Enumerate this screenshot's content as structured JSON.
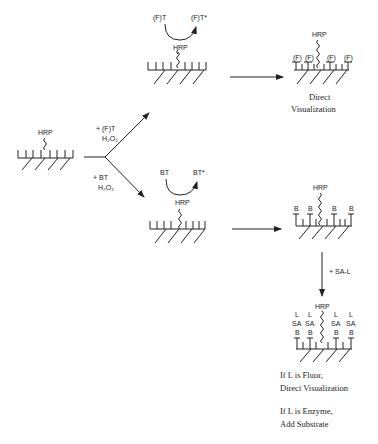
{
  "diagram": {
    "start": {
      "enzyme": "HRP"
    },
    "branch_top": {
      "reagent": "+ (F)T",
      "cofactor": "H₂O₂"
    },
    "branch_bottom": {
      "reagent": "+ BT",
      "cofactor": "H₂O₂"
    },
    "top_reaction": {
      "substrate": "(F)T",
      "product": "(F)T*",
      "enzyme": "HRP"
    },
    "bottom_reaction": {
      "substrate": "BT",
      "product": "BT*",
      "enzyme": "HRP"
    },
    "top_result": {
      "enzyme": "HRP",
      "labels": [
        "(F)",
        "(F)",
        "(F)",
        "(F)"
      ],
      "caption_line1": "Direct",
      "caption_line2": "Visualization"
    },
    "bottom_result": {
      "enzyme": "HRP",
      "labels": [
        "B",
        "B",
        "B",
        "B"
      ]
    },
    "step": {
      "reagent": "+ SA-L"
    },
    "final_result": {
      "enzyme": "HRP",
      "layer_L": [
        "L",
        "L",
        "L",
        "L"
      ],
      "layer_SA": [
        "SA",
        "SA",
        "SA",
        "SA"
      ],
      "layer_B": [
        "B",
        "B",
        "B",
        "B"
      ],
      "note1_line1": "If L is Fluor,",
      "note1_line2": "Direct  Visualization",
      "note2_line1": "If L is Enzyme,",
      "note2_line2": "Add  Substrate"
    }
  }
}
